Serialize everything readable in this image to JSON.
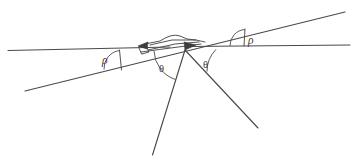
{
  "diagram": {
    "background_color": "#ffffff",
    "stroke_color": "#4a4a4a",
    "width": 353,
    "height": 162,
    "labels": {
      "rho_left": "ρ",
      "rho_right": "ρ",
      "theta_left": "θ",
      "theta_right": "θ"
    },
    "label_positions": {
      "rho_left": {
        "x": 105,
        "y": 63
      },
      "rho_right": {
        "x": 251,
        "y": 43
      },
      "theta_left": {
        "x": 162,
        "y": 69
      },
      "theta_right": {
        "x": 206,
        "y": 65
      }
    },
    "elements": {
      "horizontal_line_left": {
        "x1": 8,
        "y1": 50,
        "x2": 163,
        "y2": 47
      },
      "horizontal_line_right": {
        "x1": 196,
        "y1": 46,
        "x2": 350,
        "y2": 45
      },
      "rising_line": {
        "x1": 25,
        "y1": 91,
        "x2": 345,
        "y2": 12
      },
      "ray_lower_left": {
        "x1": 185,
        "y1": 50,
        "x2": 153,
        "y2": 155
      },
      "ray_lower_right": {
        "x1": 185,
        "y1": 50,
        "x2": 258,
        "y2": 128
      },
      "tick_left": {
        "x1": 119,
        "y1": 51,
        "x2": 121,
        "y2": 69
      },
      "tick_right": {
        "x1": 245,
        "y1": 30,
        "x2": 244,
        "y2": 46
      },
      "vertex": {
        "x": 185,
        "y": 50
      }
    },
    "angle_arcs": {
      "rho_left": {
        "cx": 121,
        "cy": 69,
        "r": 18,
        "start_deg": 180,
        "end_deg": 166
      },
      "rho_right": {
        "cx": 245,
        "cy": 46,
        "r": 16,
        "start_deg": 180,
        "end_deg": 166
      },
      "theta_left": {
        "cx": 185,
        "cy": 50,
        "r": 31,
        "start_deg": 180,
        "end_deg": 253
      },
      "theta_right": {
        "cx": 185,
        "cy": 50,
        "r": 31,
        "start_deg": 0,
        "end_deg": 47
      }
    }
  }
}
